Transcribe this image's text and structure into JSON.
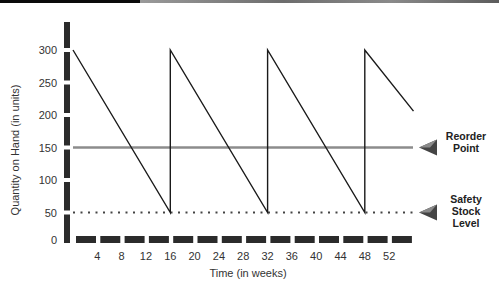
{
  "chart_data": {
    "type": "line",
    "title": "",
    "xlabel": "Time (in weeks)",
    "ylabel": "Quantity on Hand (in units)",
    "x_ticks": [
      4,
      8,
      12,
      16,
      20,
      24,
      28,
      32,
      36,
      40,
      44,
      48,
      52
    ],
    "y_ticks": [
      0,
      50,
      100,
      150,
      200,
      250,
      300
    ],
    "xlim": [
      0,
      56
    ],
    "ylim": [
      0,
      300
    ],
    "grid": false,
    "series": [
      {
        "name": "Inventory level",
        "x": [
          0,
          16,
          16,
          32,
          32,
          48,
          48,
          56
        ],
        "values": [
          300,
          50,
          300,
          50,
          300,
          50,
          300,
          206
        ]
      }
    ],
    "reference_lines": [
      {
        "name": "Reorder Point",
        "value": 150,
        "style": "solid",
        "color": "#8c8c8c"
      },
      {
        "name": "Safety Stock Level",
        "value": 50,
        "style": "dotted",
        "color": "#444444"
      }
    ],
    "annotations": [
      {
        "text": "Reorder Point",
        "target": 150,
        "position": "right"
      },
      {
        "text": "Safety Stock Level",
        "target": 50,
        "position": "right"
      }
    ]
  },
  "labels": {
    "reorder": [
      "Reorder",
      "Point"
    ],
    "safety": [
      "Safety",
      "Stock",
      "Level"
    ]
  }
}
